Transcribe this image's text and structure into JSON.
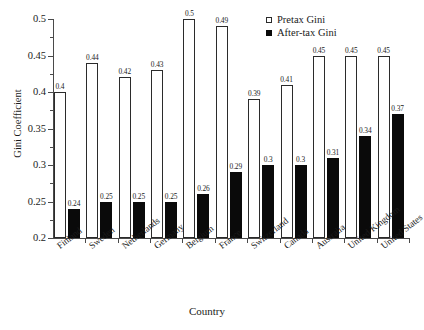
{
  "chart_data": {
    "type": "bar",
    "title": "",
    "xlabel": "Country",
    "ylabel": "Gini Coefficient",
    "ylim": [
      0.2,
      0.5
    ],
    "yticks": [
      0.2,
      0.25,
      0.3,
      0.35,
      0.4,
      0.45,
      0.5
    ],
    "ytick_labels": [
      "0.2",
      "0.25",
      "0.3",
      "0.35",
      "0.4",
      "0.45",
      "0.5"
    ],
    "grid": false,
    "legend_position": "top-right",
    "categories": [
      "Finland",
      "Sweden",
      "Netherlands",
      "Germany",
      "Belgium",
      "France",
      "Switzerland",
      "Canada",
      "Australia",
      "United Kingdom",
      "United States"
    ],
    "series": [
      {
        "name": "Pretax Gini",
        "color": "#ffffff",
        "edge_color": "#2b2b2b",
        "values": [
          0.4,
          0.44,
          0.42,
          0.43,
          0.5,
          0.49,
          0.39,
          0.41,
          0.45,
          0.45,
          0.45
        ],
        "labels": [
          "0.4",
          "0.44",
          "0.42",
          "0.43",
          "0.5",
          "0.49",
          "0.39",
          "0.41",
          "0.45",
          "0.45",
          "0.45"
        ]
      },
      {
        "name": "After-tax Gini",
        "color": "#0a0a0a",
        "edge_color": "#0a0a0a",
        "values": [
          0.24,
          0.25,
          0.25,
          0.25,
          0.26,
          0.29,
          0.3,
          0.3,
          0.31,
          0.34,
          0.37
        ],
        "labels": [
          "0.24",
          "0.25",
          "0.25",
          "0.25",
          "0.26",
          "0.29",
          "0.3",
          "0.3",
          "0.31",
          "0.34",
          "0.37"
        ]
      }
    ]
  },
  "legend": {
    "items": [
      {
        "label": "Pretax Gini",
        "marker": "open-square"
      },
      {
        "label": "After-tax Gini",
        "marker": "filled-square"
      }
    ]
  },
  "axes": {
    "y_title": "Gini Coefficient",
    "x_title": "Country"
  }
}
